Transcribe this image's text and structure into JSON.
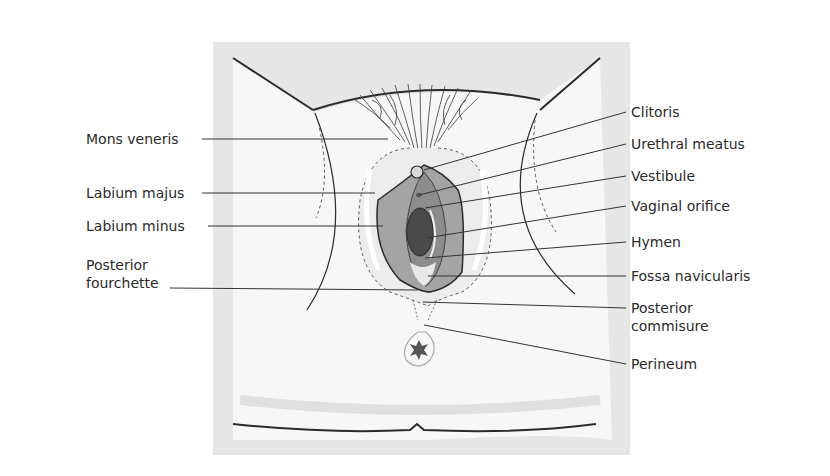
{
  "figure": {
    "type": "anatomical-diagram",
    "colors": {
      "panel": "#e6e6e6",
      "skin": "#f6f6f6",
      "outline": "#2b2b2b",
      "mucosa_light": "#b8b8b8",
      "mucosa_dark": "#6d6d6d",
      "orifice": "#4a4a4a",
      "leader_line": "#333333",
      "text": "#2a2a2a"
    }
  },
  "labels_left": [
    {
      "id": "mons-veneris",
      "lines": [
        "Mons veneris"
      ]
    },
    {
      "id": "labium-majus",
      "lines": [
        "Labium majus"
      ]
    },
    {
      "id": "labium-minus",
      "lines": [
        "Labium minus"
      ]
    },
    {
      "id": "posterior-fourchette",
      "lines": [
        "Posterior",
        "fourchette"
      ]
    }
  ],
  "labels_right": [
    {
      "id": "clitoris",
      "lines": [
        "Clitoris"
      ]
    },
    {
      "id": "urethral-meatus",
      "lines": [
        "Urethral meatus"
      ]
    },
    {
      "id": "vestibule",
      "lines": [
        "Vestibule"
      ]
    },
    {
      "id": "vaginal-orifice",
      "lines": [
        "Vaginal orifice"
      ]
    },
    {
      "id": "hymen",
      "lines": [
        "Hymen"
      ]
    },
    {
      "id": "fossa-navicularis",
      "lines": [
        "Fossa navicularis"
      ]
    },
    {
      "id": "posterior-commisure",
      "lines": [
        "Posterior",
        "commisure"
      ]
    },
    {
      "id": "perineum",
      "lines": [
        "Perineum"
      ]
    }
  ]
}
